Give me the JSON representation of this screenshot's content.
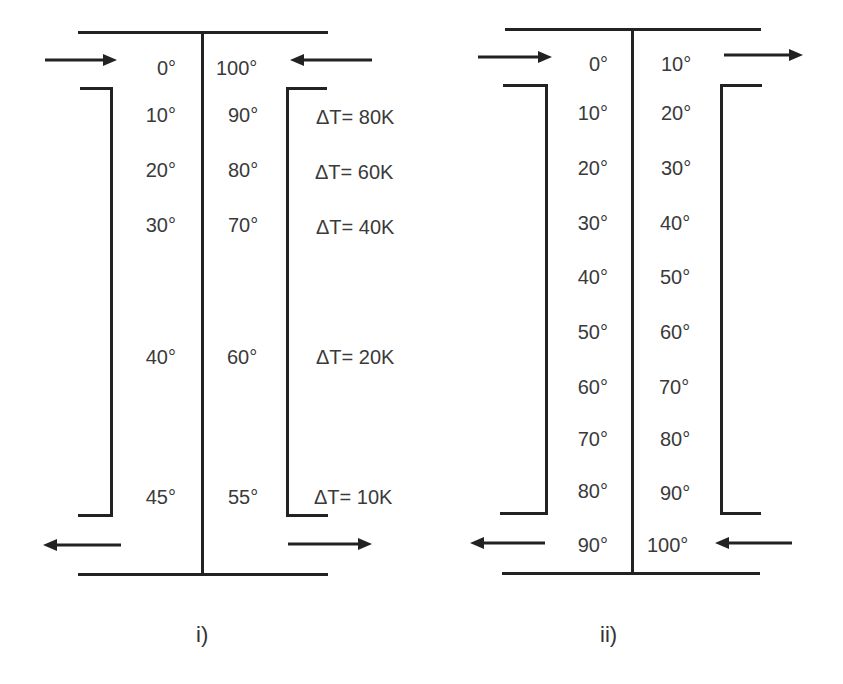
{
  "diagrams": [
    {
      "caption": "i)",
      "left_stream": [
        "0°",
        "10°",
        "20°",
        "30°",
        "40°",
        "45°"
      ],
      "right_stream": [
        "100°",
        "90°",
        "80°",
        "70°",
        "60°",
        "55°"
      ],
      "delta_t": [
        "ΔT= 80K",
        "ΔT= 60K",
        "ΔT= 40K",
        "ΔT= 20K",
        "ΔT= 10K"
      ],
      "flow": "counter-current"
    },
    {
      "caption": "ii)",
      "left_stream": [
        "0°",
        "10°",
        "20°",
        "30°",
        "40°",
        "50°",
        "60°",
        "70°",
        "80°",
        "90°"
      ],
      "right_stream": [
        "10°",
        "20°",
        "30°",
        "40°",
        "50°",
        "60°",
        "70°",
        "80°",
        "90°",
        "100°"
      ],
      "flow": "mixed"
    }
  ],
  "colors": {
    "line": "#222222",
    "text": "#3a3a3a",
    "background": "#ffffff"
  }
}
